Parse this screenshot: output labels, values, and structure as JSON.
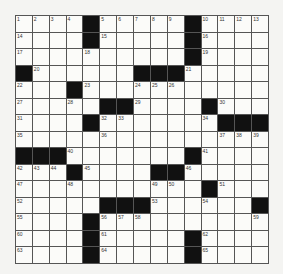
{
  "puzzle": {
    "rows": 15,
    "cols": 15,
    "grid": [
      [
        "1",
        "2",
        "3",
        "4",
        "#",
        "5",
        "6",
        "7",
        "8",
        "9",
        "#",
        "10",
        "11",
        "12",
        "13"
      ],
      [
        "14",
        "",
        "",
        "",
        "#",
        "15",
        "",
        "",
        "",
        "",
        "#",
        "16",
        "",
        "",
        ""
      ],
      [
        "17",
        "",
        "",
        "",
        "18",
        "",
        "",
        "",
        "",
        "",
        "#",
        "19",
        "",
        "",
        ""
      ],
      [
        "#",
        "20",
        "",
        "",
        "",
        "",
        "",
        "#",
        "#",
        "#",
        "21",
        "",
        "",
        "",
        ""
      ],
      [
        "22",
        "",
        "",
        "#",
        "23",
        "",
        "",
        "24",
        "25",
        "26",
        "",
        "",
        "",
        "",
        ""
      ],
      [
        "27",
        "",
        "",
        "28",
        "",
        "#",
        "#",
        "29",
        "",
        "",
        "",
        "#",
        "30",
        "",
        ""
      ],
      [
        "31",
        "",
        "",
        "",
        "#",
        "32",
        "33",
        "",
        "",
        "",
        "",
        "34",
        "#",
        "#",
        "#"
      ],
      [
        "35",
        "",
        "",
        "",
        "",
        "36",
        "",
        "",
        "",
        "",
        "",
        "",
        "37",
        "38",
        "39"
      ],
      [
        "#",
        "#",
        "#",
        "40",
        "",
        "",
        "",
        "",
        "",
        "",
        "#",
        "41",
        "",
        "",
        ""
      ],
      [
        "42",
        "43",
        "44",
        "#",
        "45",
        "",
        "",
        "",
        "#",
        "#",
        "46",
        "",
        "",
        "",
        ""
      ],
      [
        "47",
        "",
        "",
        "48",
        "",
        "",
        "",
        "",
        "49",
        "50",
        "",
        "#",
        "51",
        "",
        ""
      ],
      [
        "52",
        "",
        "",
        "",
        "",
        "#",
        "#",
        "#",
        "53",
        "",
        "",
        "54",
        "",
        "",
        "#"
      ],
      [
        "55",
        "",
        "",
        "",
        "#",
        "56",
        "57",
        "58",
        "",
        "",
        "",
        "",
        "",
        "",
        "59"
      ],
      [
        "60",
        "",
        "",
        "",
        "#",
        "61",
        "",
        "",
        "",
        "",
        "#",
        "62",
        "",
        "",
        ""
      ],
      [
        "63",
        "",
        "",
        "",
        "#",
        "64",
        "",
        "",
        "",
        "",
        "#",
        "65",
        "",
        "",
        ""
      ]
    ]
  }
}
